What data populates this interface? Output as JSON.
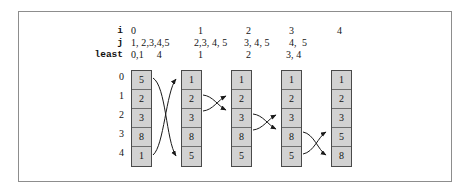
{
  "figure": {
    "kind": "selection-sort-trace-diagram",
    "header_row_labels": [
      "i",
      "j",
      "least"
    ],
    "row_indices": [
      "0",
      "1",
      "2",
      "3",
      "4"
    ],
    "header": {
      "i": [
        "0",
        "1",
        "2",
        "3",
        "4"
      ],
      "j": [
        "1, 2,3,4,5",
        "2,3, 4, 5",
        "3, 4, 5",
        "4,  5",
        ""
      ],
      "least": [
        "0,1     4",
        "1",
        "2",
        "3, 4",
        ""
      ]
    },
    "columns": [
      {
        "name": "pass-0",
        "values": [
          "5",
          "2",
          "3",
          "8",
          "1"
        ]
      },
      {
        "name": "pass-1",
        "values": [
          "1",
          "2",
          "3",
          "8",
          "5"
        ]
      },
      {
        "name": "pass-2",
        "values": [
          "1",
          "2",
          "3",
          "8",
          "5"
        ]
      },
      {
        "name": "pass-3",
        "values": [
          "1",
          "2",
          "3",
          "8",
          "5"
        ]
      },
      {
        "name": "pass-4",
        "values": [
          "1",
          "2",
          "3",
          "5",
          "8"
        ]
      }
    ],
    "swaps": [
      {
        "name": "swap-0-4",
        "from_column": 0,
        "to_column": 1,
        "rows": [
          0,
          4
        ]
      },
      {
        "name": "swap-1-2",
        "from_column": 1,
        "to_column": 2,
        "rows": [
          1,
          2
        ]
      },
      {
        "name": "swap-2-3",
        "from_column": 2,
        "to_column": 3,
        "rows": [
          2,
          3
        ]
      },
      {
        "name": "swap-3-4",
        "from_column": 3,
        "to_column": 4,
        "rows": [
          3,
          4
        ]
      }
    ],
    "colors": {
      "cell_fill": "#d2d2d2",
      "cell_border": "#4a4a4a",
      "frame_border": "#8d8d8d",
      "arrow": "#1a1a1a",
      "text": "#141414",
      "background": "#ffffff"
    },
    "geometry": {
      "column_x": [
        131,
        181,
        231,
        281,
        331
      ],
      "column_top": 70,
      "cell_height": 19,
      "cell_width": 21
    }
  }
}
